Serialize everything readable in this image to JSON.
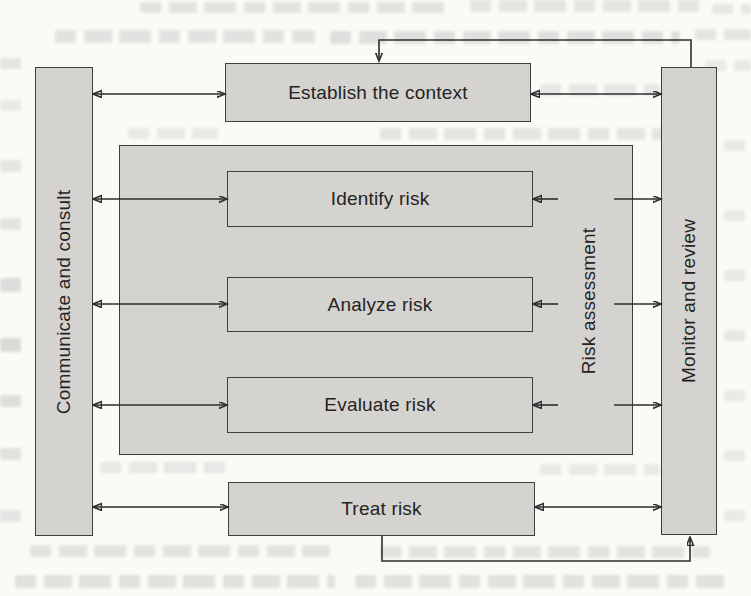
{
  "diagram": {
    "side_bars": {
      "left": {
        "label": "Communicate and consult"
      },
      "right": {
        "label": "Monitor and review"
      }
    },
    "nodes": {
      "establish": {
        "label": "Establish the context"
      },
      "treat": {
        "label": "Treat risk"
      }
    },
    "risk_assessment_group": {
      "label": "Risk assessment",
      "steps": [
        {
          "label": "Identify risk"
        },
        {
          "label": "Analyze risk"
        },
        {
          "label": "Evaluate risk"
        }
      ]
    },
    "colors": {
      "box_fill": "#d4d3d0",
      "box_border": "#3e3e3e",
      "arrow": "#2e2e2e",
      "text": "#242424",
      "page_background": "#fbfaf7"
    }
  }
}
